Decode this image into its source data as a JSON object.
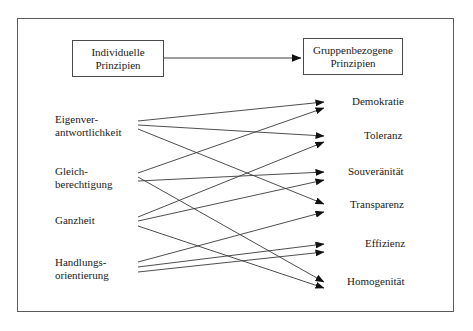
{
  "diagram": {
    "title_boxes": {
      "individual": {
        "line1": "Individuelle",
        "line2": "Prinzipien"
      },
      "group": {
        "line1": "Gruppenbezogene",
        "line2": "Prinzipien"
      }
    },
    "top_connector": {
      "name": "individual-to-group-arrow",
      "from_x": 164,
      "from_y": 58,
      "to_x": 301,
      "to_y": 58
    },
    "left_principles": [
      {
        "id": "eigenverantwortlichkeit",
        "line1": "Eigenver-",
        "line2": "antwortlichkeit",
        "x": 55,
        "y": 113,
        "anchor_x": 138,
        "anchor_ys": [
          121,
          125,
          129
        ]
      },
      {
        "id": "gleichberechtigung",
        "line1": "Gleich-",
        "line2": "berechtigung",
        "x": 55,
        "y": 165,
        "anchor_x": 138,
        "anchor_ys": [
          173,
          177,
          181
        ]
      },
      {
        "id": "ganzheit",
        "line1": "Ganzheit",
        "line2": "",
        "x": 55,
        "y": 214,
        "anchor_x": 138,
        "anchor_ys": [
          217,
          221,
          226
        ]
      },
      {
        "id": "handlungsorientierung",
        "line1": "Handlungs-",
        "line2": "orientierung",
        "x": 55,
        "y": 256,
        "anchor_x": 138,
        "anchor_ys": [
          262,
          267,
          272
        ]
      }
    ],
    "right_principles": [
      {
        "id": "demokratie",
        "label": "Demokratie",
        "x": 352,
        "y": 95,
        "arrow_ys": [
          102,
          108
        ]
      },
      {
        "id": "toleranz",
        "label": "Toleranz",
        "x": 364,
        "y": 129,
        "arrow_ys": [
          136,
          142
        ]
      },
      {
        "id": "souveraenitaet",
        "label": "Souveränität",
        "x": 348,
        "y": 165,
        "arrow_ys": [
          172,
          180
        ]
      },
      {
        "id": "transparenz",
        "label": "Transparenz",
        "x": 350,
        "y": 198,
        "arrow_ys": [
          204,
          212
        ]
      },
      {
        "id": "effizienz",
        "label": "Effizienz",
        "x": 365,
        "y": 237,
        "arrow_ys": [
          244,
          252
        ]
      },
      {
        "id": "homogenitaet",
        "label": "Homogenität",
        "x": 347,
        "y": 275,
        "arrow_ys": [
          282,
          288
        ]
      }
    ],
    "edges": [
      {
        "from": "eigenverantwortlichkeit",
        "to": "demokratie",
        "x1": 138,
        "y1": 121,
        "x2": 324,
        "y2": 102
      },
      {
        "from": "eigenverantwortlichkeit",
        "to": "toleranz",
        "x1": 138,
        "y1": 125,
        "x2": 324,
        "y2": 136
      },
      {
        "from": "eigenverantwortlichkeit",
        "to": "transparenz",
        "x1": 138,
        "y1": 129,
        "x2": 324,
        "y2": 204
      },
      {
        "from": "gleichberechtigung",
        "to": "demokratie",
        "x1": 138,
        "y1": 173,
        "x2": 324,
        "y2": 108
      },
      {
        "from": "gleichberechtigung",
        "to": "souveraenitaet",
        "x1": 138,
        "y1": 181,
        "x2": 324,
        "y2": 172
      },
      {
        "from": "gleichberechtigung",
        "to": "homogenitaet",
        "x1": 138,
        "y1": 177,
        "x2": 324,
        "y2": 282
      },
      {
        "from": "ganzheit",
        "to": "toleranz",
        "x1": 138,
        "y1": 217,
        "x2": 324,
        "y2": 142
      },
      {
        "from": "ganzheit",
        "to": "souveraenitaet",
        "x1": 138,
        "y1": 221,
        "x2": 324,
        "y2": 180
      },
      {
        "from": "ganzheit",
        "to": "homogenitaet",
        "x1": 138,
        "y1": 226,
        "x2": 324,
        "y2": 288
      },
      {
        "from": "handlungsorientierung",
        "to": "transparenz",
        "x1": 138,
        "y1": 262,
        "x2": 324,
        "y2": 212
      },
      {
        "from": "handlungsorientierung",
        "to": "effizienz",
        "x1": 138,
        "y1": 267,
        "x2": 324,
        "y2": 244
      },
      {
        "from": "handlungsorientierung",
        "to": "effizienz2",
        "x1": 138,
        "y1": 272,
        "x2": 324,
        "y2": 252
      }
    ],
    "colors": {
      "frame": "#5a5a5a",
      "box_border": "#4a4a4a",
      "line": "#3a3a3a",
      "text": "#1a1a1a",
      "background": "#ffffff"
    }
  }
}
